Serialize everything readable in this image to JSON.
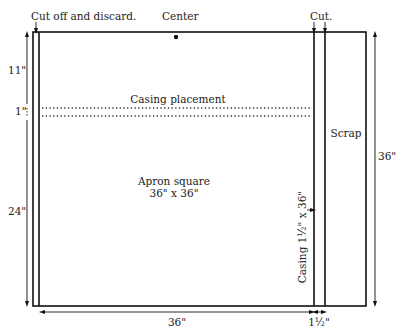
{
  "diagram": {
    "labels": {
      "cut_off": "Cut off and discard.",
      "center": "Center",
      "cut": "Cut.",
      "casing_placement": "Casing placement",
      "apron_line1": "Apron square",
      "apron_line2": "36\" x 36\"",
      "scrap": "Scrap",
      "casing_strip": "Casing 1½\" x 36\""
    },
    "dimensions": {
      "top_offset": "11\"",
      "casing_gap": "1\"",
      "lower_height": "24\"",
      "total_height": "36\"",
      "apron_width": "36\"",
      "casing_width": "1½\""
    },
    "colors": {
      "line": "#111111",
      "text": "#222222",
      "background": "#ffffff"
    }
  }
}
